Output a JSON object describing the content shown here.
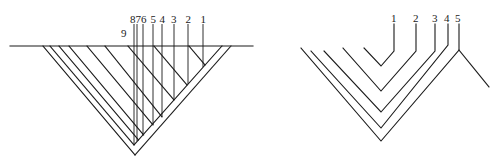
{
  "figure": {
    "background": "#ffffff",
    "stroke_color": "#1a1a1a"
  },
  "left_diagram": {
    "description": "Inverted triangular section cut by a horizontal line with numbered vertical markers",
    "horizontal_line": {
      "x1": 10,
      "y": 46,
      "x2": 253
    },
    "apex": {
      "x": 135,
      "y": 155
    },
    "outer_right_edge": {
      "x1": 231,
      "y1": 46,
      "x2": 135,
      "y2": 155
    },
    "inner_right_edge": {
      "x1": 222,
      "y1": 46,
      "x2": 134,
      "y2": 145
    },
    "diagonals": [
      {
        "x0": 43,
        "end_x": 135,
        "end_y": 155
      },
      {
        "x0": 50,
        "end_x": 134,
        "end_y": 145
      },
      {
        "x0": 59,
        "end_x": 138.5,
        "end_y": 140
      },
      {
        "x0": 69,
        "end_x": 143.6,
        "end_y": 135
      },
      {
        "x0": 87,
        "end_x": 153,
        "end_y": 125
      },
      {
        "x0": 105,
        "end_x": 162,
        "end_y": 117
      },
      {
        "x0": 128,
        "end_x": 174,
        "end_y": 100
      },
      {
        "x0": 154,
        "end_x": 187,
        "end_y": 85
      },
      {
        "x0": 189,
        "end_x": 205,
        "end_y": 65
      }
    ],
    "verticals": [
      {
        "label": "8",
        "x": 134,
        "label_x": 133,
        "y_top": 24,
        "y_bottom": 145
      },
      {
        "label": "7",
        "x": 137,
        "label_x": 138,
        "y_top": 24,
        "y_bottom": 141
      },
      {
        "label": "6",
        "x": 143,
        "label_x": 143,
        "y_top": 24,
        "y_bottom": 135
      },
      {
        "label": "5",
        "x": 153,
        "label_x": 153,
        "y_top": 24,
        "y_bottom": 125
      },
      {
        "label": "4",
        "x": 162,
        "label_x": 162,
        "y_top": 24,
        "y_bottom": 117
      },
      {
        "label": "3",
        "x": 174,
        "label_x": 173,
        "y_top": 24,
        "y_bottom": 100
      },
      {
        "label": "2",
        "x": 188,
        "label_x": 188,
        "y_top": 24,
        "y_bottom": 84
      },
      {
        "label": "1",
        "x": 203,
        "label_x": 203,
        "y_top": 24,
        "y_bottom": 67
      }
    ],
    "labels": {
      "l1": "1",
      "l2": "2",
      "l3": "3",
      "l4": "4",
      "l5": "5",
      "l6": "6",
      "l7": "7",
      "l8": "8",
      "l9": "9"
    },
    "label9": {
      "text": "9",
      "x": 124,
      "y": 37
    }
  },
  "right_diagram": {
    "description": "Nested V-shaped layers numbered 1 to 5",
    "apex_x": 381,
    "layers": [
      {
        "label": "1",
        "left_x": 364,
        "left_y": 48,
        "bottom_y": 66,
        "right_x": 394,
        "right_y": 51,
        "top_y": 24
      },
      {
        "label": "2",
        "left_x": 343,
        "left_y": 48,
        "bottom_y": 91,
        "right_x": 416,
        "right_y": 51,
        "top_y": 24
      },
      {
        "label": "3",
        "left_x": 324,
        "left_y": 51,
        "bottom_y": 112,
        "right_x": 435,
        "right_y": 51,
        "top_y": 24
      },
      {
        "label": "4",
        "left_x": 311,
        "left_y": 51,
        "bottom_y": 128,
        "right_x": 448,
        "right_y": 45,
        "top_y": 24
      },
      {
        "label": "5",
        "left_x": 301,
        "left_y": 48,
        "bottom_y": 141,
        "right_x": 459,
        "right_y": 50,
        "top_y": 24
      }
    ],
    "tail": {
      "x1": 459,
      "y1": 50,
      "x2": 489,
      "y2": 87
    },
    "labels": {
      "l1": "1",
      "l2": "2",
      "l3": "3",
      "l4": "4",
      "l5": "5"
    }
  }
}
